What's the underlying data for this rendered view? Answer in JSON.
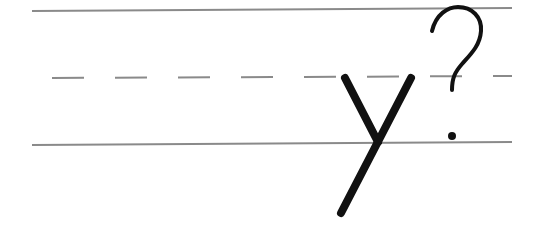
{
  "worksheet": {
    "letter": "y",
    "punctuation": "?",
    "guide_line_color": "#8a8a8a",
    "ink_color": "#111111",
    "guides": {
      "top_line_y": 11,
      "midline_y": 77,
      "baseline_y": 144,
      "x_start": 32,
      "x_end": 512,
      "dash_start": 52,
      "dash_length": 32,
      "dash_gap": 30
    }
  }
}
